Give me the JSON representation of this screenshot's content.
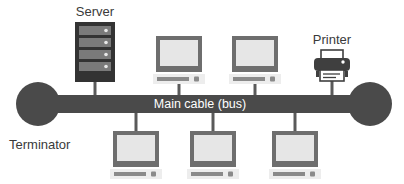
{
  "diagram": {
    "type": "network-topology",
    "topology": "bus",
    "canvas": {
      "width": 404,
      "height": 184,
      "background": "#ffffff"
    },
    "colors": {
      "bus_cable": "#4a4a4a",
      "terminator": "#4a4a4a",
      "server_body": "#333333",
      "server_bay": "#7a7a7a",
      "monitor_frame": "#6e6e6e",
      "monitor_screen": "#e2e2e2",
      "monitor_base": "#ededed",
      "monitor_keyboard": "#8a8a8a",
      "connector_line": "#5a5a5a",
      "printer_body": "#3f3f3f",
      "printer_paper": "#ffffff",
      "label": "#3a3a3a",
      "bus_label": "#ffffff"
    },
    "bus": {
      "label": "Main cable (bus)",
      "x": 25,
      "y": 95,
      "width": 350,
      "height": 18
    },
    "terminators": [
      {
        "name": "left-terminator",
        "cx": 38,
        "cy": 104,
        "r": 22,
        "label": "Terminator"
      },
      {
        "name": "right-terminator",
        "cx": 370,
        "cy": 104,
        "r": 22,
        "label": ""
      }
    ],
    "labels": {
      "terminator": "Terminator",
      "server": "Server",
      "printer": "Printer",
      "bus": "Main cable (bus)"
    },
    "nodes": [
      {
        "id": "server",
        "kind": "server",
        "label": "Server",
        "label_x": 95,
        "label_y": 15,
        "x": 75,
        "y": 22,
        "width": 40,
        "height": 60,
        "bays": 4,
        "drop_x": 95,
        "drop_from": 82,
        "drop_to": 95
      },
      {
        "id": "workstation-top-1",
        "kind": "monitor",
        "label": "",
        "x": 156,
        "y": 36,
        "width": 46,
        "height": 36,
        "drop_x": 179,
        "drop_from": 80,
        "drop_to": 95
      },
      {
        "id": "workstation-top-2",
        "kind": "monitor",
        "label": "",
        "x": 232,
        "y": 36,
        "width": 46,
        "height": 36,
        "drop_x": 255,
        "drop_from": 80,
        "drop_to": 95
      },
      {
        "id": "printer",
        "kind": "printer",
        "label": "Printer",
        "label_x": 332,
        "label_y": 43,
        "x": 314,
        "y": 52,
        "width": 36,
        "height": 32,
        "drop_x": 332,
        "drop_from": 84,
        "drop_to": 95
      },
      {
        "id": "workstation-bottom-1",
        "kind": "monitor",
        "label": "",
        "x": 113,
        "y": 131,
        "width": 46,
        "height": 36,
        "drop_x": 136,
        "drop_from": 113,
        "drop_to": 131
      },
      {
        "id": "workstation-bottom-2",
        "kind": "monitor",
        "label": "",
        "x": 190,
        "y": 131,
        "width": 46,
        "height": 36,
        "drop_x": 213,
        "drop_from": 113,
        "drop_to": 131
      },
      {
        "id": "workstation-bottom-3",
        "kind": "monitor",
        "label": "",
        "x": 272,
        "y": 131,
        "width": 46,
        "height": 36,
        "drop_x": 295,
        "drop_from": 113,
        "drop_to": 131
      }
    ]
  }
}
